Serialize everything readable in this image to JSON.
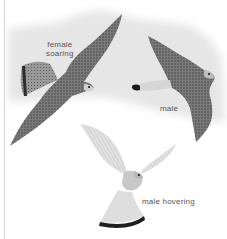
{
  "illustration": {
    "subject": "kestrel flight poses",
    "background_tint": "#e9e9e9",
    "figures": [
      {
        "id": "female-soaring",
        "label_line1": "female",
        "label_line2": "soaring"
      },
      {
        "id": "male",
        "label": "male"
      },
      {
        "id": "male-hovering",
        "label": "male hovering"
      }
    ]
  }
}
